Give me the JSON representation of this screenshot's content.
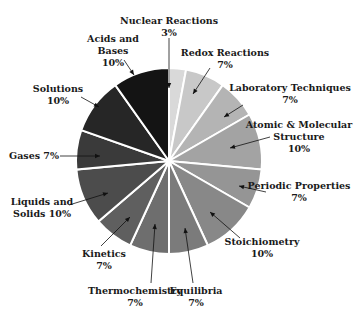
{
  "chart_data": {
    "type": "pie",
    "title": "",
    "start_angle_deg": 0,
    "direction": "clockwise",
    "slices": [
      {
        "label": "Nuclear Reactions",
        "value": 3,
        "display": "3%",
        "color": "#d9d9d9"
      },
      {
        "label": "Redox Reactions",
        "value": 7,
        "display": "7%",
        "color": "#c8c8c8"
      },
      {
        "label": "Laboratory Techniques",
        "value": 7,
        "display": "7%",
        "color": "#b4b4b4"
      },
      {
        "label": "Atomic & Molecular Structure",
        "value": 10,
        "display": "10%",
        "color": "#a3a3a3"
      },
      {
        "label": "Periodic Properties",
        "value": 7,
        "display": "7%",
        "color": "#959595"
      },
      {
        "label": "Stoichiometry",
        "value": 10,
        "display": "10%",
        "color": "#888888"
      },
      {
        "label": "Equilibria",
        "value": 7,
        "display": "7%",
        "color": "#7b7b7b"
      },
      {
        "label": "Thermochemistry",
        "value": 7,
        "display": "7%",
        "color": "#6e6e6e"
      },
      {
        "label": "Kinetics",
        "value": 7,
        "display": "7%",
        "color": "#5f5f5f"
      },
      {
        "label": "Liquids and Solids",
        "value": 10,
        "display": "10%",
        "color": "#4c4c4c"
      },
      {
        "label": "Gases",
        "value": 7,
        "display": "7%",
        "color": "#3a3a3a"
      },
      {
        "label": "Solutions",
        "value": 10,
        "display": "10%",
        "color": "#262626"
      },
      {
        "label": "Acids and Bases",
        "value": 10,
        "display": "10%",
        "color": "#141414"
      }
    ]
  },
  "labels": [
    {
      "lines": [
        "Nuclear Reactions",
        "3%"
      ],
      "x": 169,
      "y": 24,
      "anchor": "middle",
      "arrow": [
        169,
        38,
        169,
        88
      ]
    },
    {
      "lines": [
        "Redox Reactions",
        "7%"
      ],
      "x": 225,
      "y": 56,
      "anchor": "middle",
      "arrow": [
        210,
        68,
        193,
        94
      ]
    },
    {
      "lines": [
        "Laboratory Techniques",
        "7%"
      ],
      "x": 290,
      "y": 91,
      "anchor": "middle",
      "arrow": [
        243,
        105,
        224,
        117
      ]
    },
    {
      "lines": [
        "Atomic & Molecular",
        "Structure",
        "10%"
      ],
      "x": 299,
      "y": 128,
      "anchor": "middle",
      "arrow": [
        270,
        137,
        230,
        148
      ]
    },
    {
      "lines": [
        "Periodic Properties",
        "7%"
      ],
      "x": 299,
      "y": 189,
      "anchor": "middle",
      "arrow": [
        266,
        192,
        239,
        186
      ]
    },
    {
      "lines": [
        "Stoichiometry",
        "10%"
      ],
      "x": 262,
      "y": 245,
      "anchor": "middle",
      "arrow": [
        240,
        238,
        210,
        212
      ]
    },
    {
      "lines": [
        "Equilibria",
        "7%"
      ],
      "x": 196,
      "y": 294,
      "anchor": "middle",
      "arrow": [
        193,
        283,
        185,
        228
      ]
    },
    {
      "lines": [
        "Thermochemistry",
        "7%"
      ],
      "x": 135,
      "y": 294,
      "anchor": "middle",
      "arrow": [
        151,
        283,
        155,
        224
      ]
    },
    {
      "lines": [
        "Kinetics",
        "7%"
      ],
      "x": 104,
      "y": 257,
      "anchor": "middle",
      "arrow": [
        101,
        246,
        130,
        217
      ]
    },
    {
      "lines": [
        "Liquids and",
        "Solids 10%"
      ],
      "x": 42,
      "y": 205,
      "anchor": "middle",
      "arrow": [
        69,
        205,
        108,
        193
      ]
    },
    {
      "lines": [
        "Gases 7%"
      ],
      "x": 34,
      "y": 159,
      "anchor": "middle",
      "arrow": [
        60,
        156,
        100,
        156
      ]
    },
    {
      "lines": [
        "Solutions",
        "10%"
      ],
      "x": 58,
      "y": 92,
      "anchor": "middle",
      "arrow": [
        81,
        97,
        99,
        107
      ]
    },
    {
      "lines": [
        "Acids and",
        "Bases",
        "10%"
      ],
      "x": 113,
      "y": 42,
      "anchor": "middle",
      "arrow": [
        124,
        60,
        134,
        75
      ]
    }
  ],
  "geometry": {
    "cx": 169,
    "cy": 161,
    "r": 93
  }
}
